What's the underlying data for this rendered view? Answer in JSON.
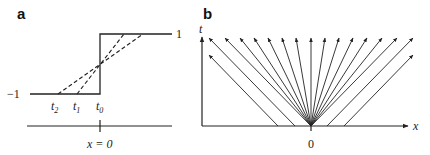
{
  "panel_a": {
    "label": "a",
    "y_high_label": "1",
    "y_low_label": "−1",
    "time_labels": [
      {
        "base": "t",
        "sub": "2"
      },
      {
        "base": "t",
        "sub": "1"
      },
      {
        "base": "t",
        "sub": "0"
      }
    ],
    "axis_label": "x = 0",
    "step": {
      "low": -1,
      "high": 1,
      "jump_at": "x = 0"
    },
    "curves": [
      "solid step at t0",
      "dashed ramp at t1",
      "dashed ramp at t2"
    ]
  },
  "panel_b": {
    "label": "b",
    "y_axis_label": "t",
    "x_axis_label": "x",
    "origin_label": "0",
    "fan_line_count": 13,
    "parallel_left_line_count": 2,
    "parallel_right_line_count": 2,
    "colors": {
      "line": "#222222",
      "background": "#ffffff"
    }
  }
}
